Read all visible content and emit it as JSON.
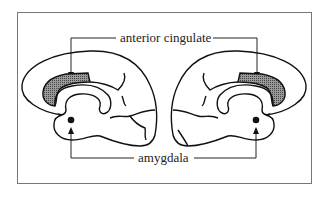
{
  "diagram": {
    "type": "anatomical-figure",
    "labels": {
      "anterior_cingulate": "anterior cingulate",
      "amygdala": "amygdala"
    },
    "regions": [
      {
        "name": "anterior cingulate",
        "marker": "stippled shaded area",
        "hemispheres": [
          "left",
          "right"
        ]
      },
      {
        "name": "amygdala",
        "marker": "filled dot",
        "hemispheres": [
          "left",
          "right"
        ]
      }
    ],
    "colors": {
      "outline": "#1a1a1a",
      "shading": "#6e6e6e",
      "frame": "#777777",
      "background": "#ffffff"
    }
  }
}
